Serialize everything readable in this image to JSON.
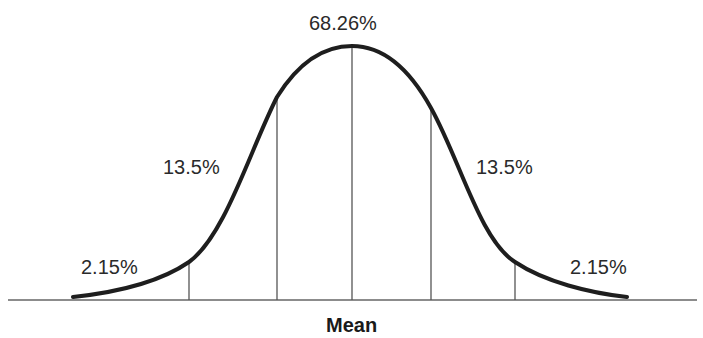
{
  "diagram": {
    "type": "normal-distribution-curve",
    "labels": {
      "center": "68.26%",
      "left_inner": "13.5%",
      "right_inner": "13.5%",
      "left_tail": "2.15%",
      "right_tail": "2.15%",
      "axis": "Mean"
    },
    "regions": [
      {
        "name": "left-tail",
        "percent": "2.15%"
      },
      {
        "name": "left-inner",
        "percent": "13.5%"
      },
      {
        "name": "center",
        "percent": "68.26%"
      },
      {
        "name": "right-inner",
        "percent": "13.5%"
      },
      {
        "name": "right-tail",
        "percent": "2.15%"
      }
    ],
    "colors": {
      "curve": "#1e1e1e",
      "lines": "#555555",
      "text": "#2a2a2a"
    }
  }
}
